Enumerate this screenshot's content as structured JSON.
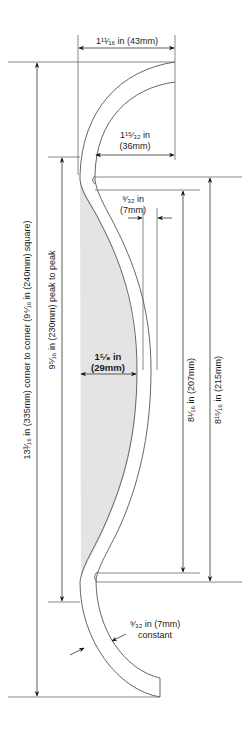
{
  "diagram": {
    "title": "",
    "colors": {
      "line": "#555555",
      "shade": "#e4e4e4",
      "text": "#1a1a1a"
    },
    "dimensions": {
      "top_width": {
        "line1": "1¹¹⁄₁₆ in (43mm)"
      },
      "inner_width": {
        "line1": "1¹⁵⁄₃₂ in",
        "line2": "(36mm)"
      },
      "gap": {
        "line1": "⁹⁄₃₂ in",
        "line2": "(7mm)"
      },
      "depth": {
        "line1": "1⁵⁄₈ in",
        "line2": "(29mm)"
      },
      "height_207": {
        "label": "8¹⁄₁₆ in (207mm)"
      },
      "height_215": {
        "label": "8¹⁵⁄₁₆ in (215mm)"
      },
      "peak_to_peak": {
        "label": "9⁵⁄₁₆ in (230mm) peak to peak"
      },
      "corner_to_corner": {
        "label": "13³⁄₁₆ in (335mm) corner to corner (9⁴⁄₁₆ in (240mm) square)"
      },
      "thickness": {
        "line1": "⁹⁄₃₂ in (7mm)",
        "line2": "constant"
      }
    }
  }
}
